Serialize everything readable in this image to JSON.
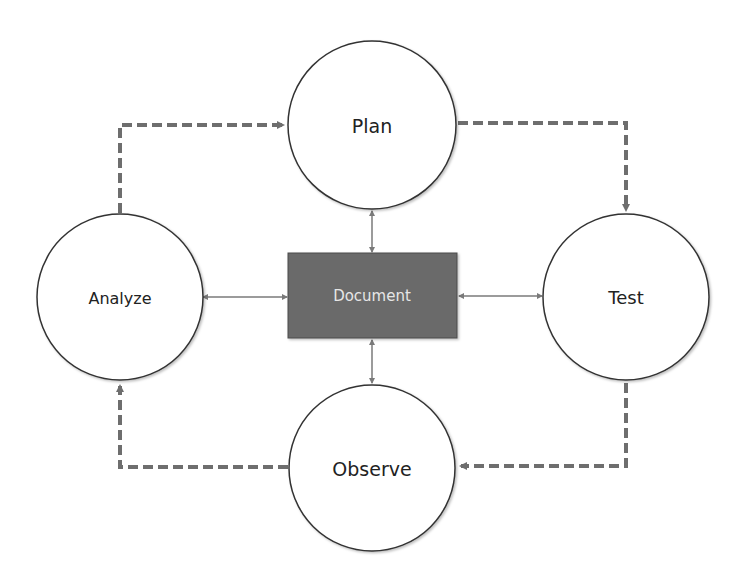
{
  "diagram": {
    "type": "cycle",
    "colors": {
      "background": "#ffffff",
      "circle_stroke": "#333333",
      "circle_fill": "#ffffff",
      "document_fill": "#6b6b6b",
      "document_stroke": "#4a4a4a",
      "document_text": "#e6e6e6",
      "dashed_arrow": "#6e6e6e",
      "solid_arrow": "#7a7a7a",
      "label_text": "#222222"
    },
    "nodes": {
      "plan": {
        "label": "Plan",
        "shape": "circle"
      },
      "test": {
        "label": "Test",
        "shape": "circle"
      },
      "observe": {
        "label": "Observe",
        "shape": "circle"
      },
      "analyze": {
        "label": "Analyze",
        "shape": "circle"
      },
      "document": {
        "label": "Document",
        "shape": "rectangle"
      }
    },
    "edges": [
      {
        "from": "Plan",
        "to": "Test",
        "style": "dashed",
        "direction": "one-way"
      },
      {
        "from": "Test",
        "to": "Observe",
        "style": "dashed",
        "direction": "one-way"
      },
      {
        "from": "Observe",
        "to": "Analyze",
        "style": "dashed",
        "direction": "one-way"
      },
      {
        "from": "Analyze",
        "to": "Plan",
        "style": "dashed",
        "direction": "one-way"
      },
      {
        "from": "Document",
        "to": "Plan",
        "style": "solid",
        "direction": "two-way"
      },
      {
        "from": "Document",
        "to": "Test",
        "style": "solid",
        "direction": "two-way"
      },
      {
        "from": "Document",
        "to": "Observe",
        "style": "solid",
        "direction": "two-way"
      },
      {
        "from": "Document",
        "to": "Analyze",
        "style": "solid",
        "direction": "two-way"
      }
    ]
  }
}
